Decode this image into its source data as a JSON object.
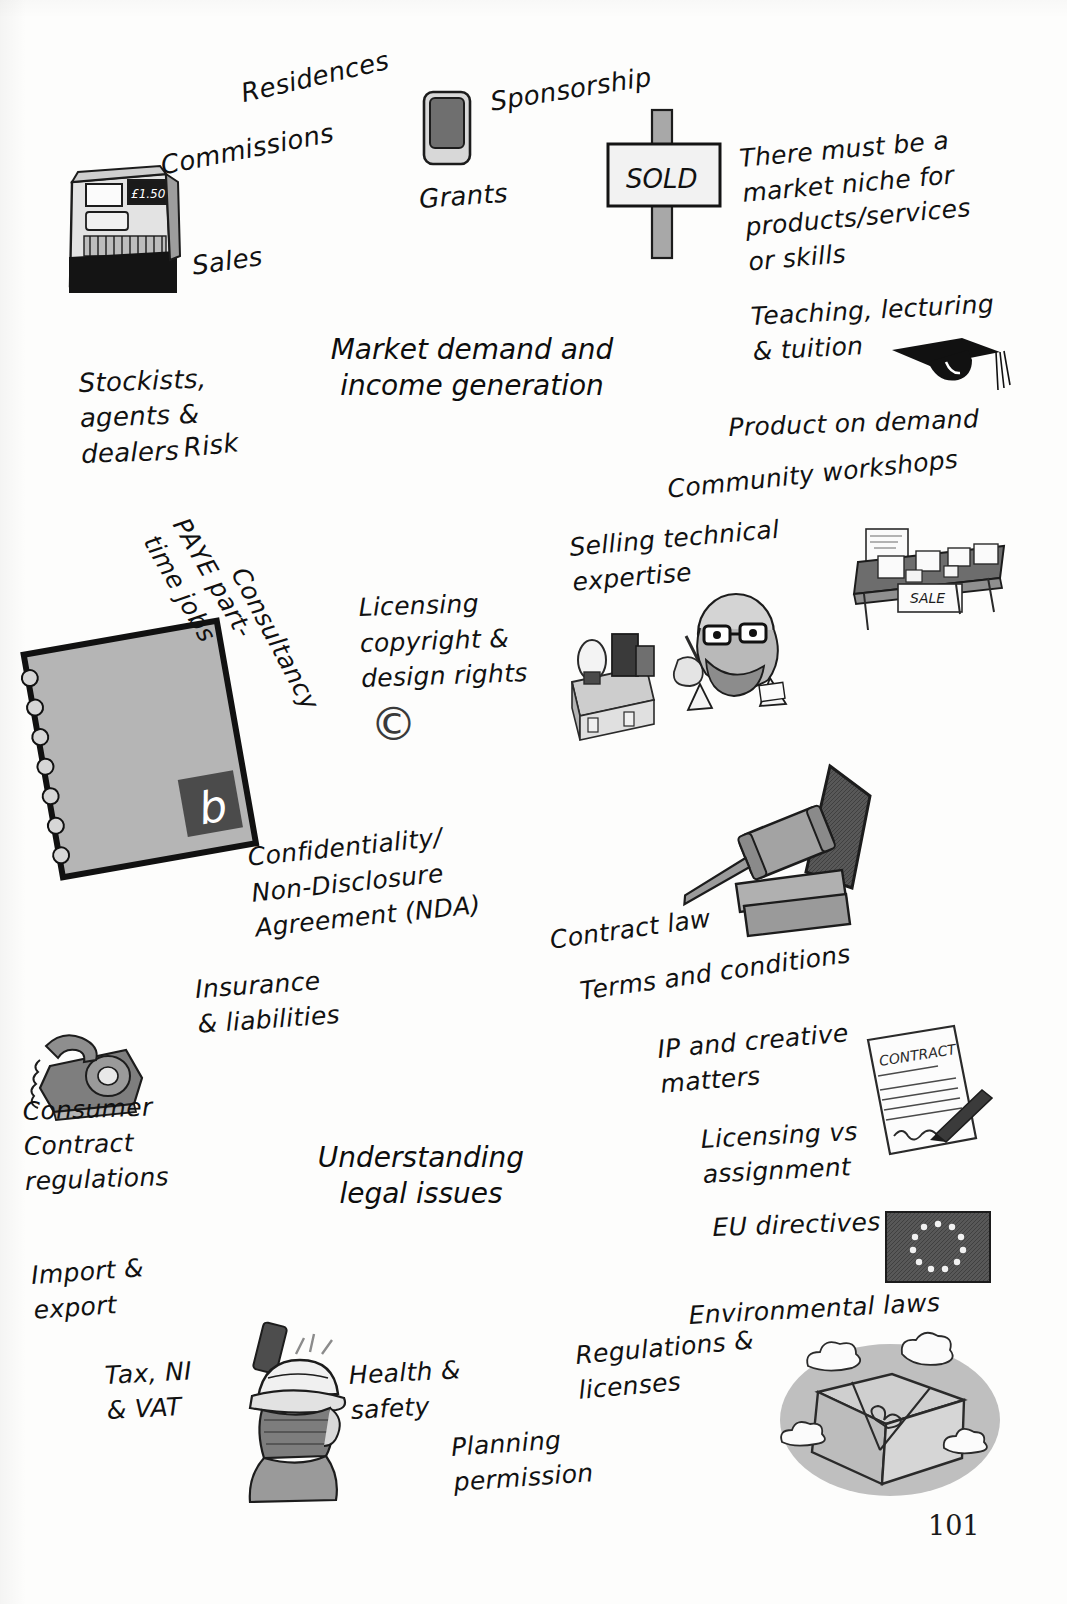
{
  "document": {
    "type": "hand-drawn mind map",
    "page_number": "101"
  },
  "nodes": [
    {
      "id": "market",
      "label": "Market demand and\nincome generation"
    },
    {
      "id": "legal",
      "label": "Understanding\nlegal issues"
    }
  ],
  "market_branches": [
    {
      "id": "residences",
      "label": "Residences"
    },
    {
      "id": "commissions",
      "label": "Commissions"
    },
    {
      "id": "sales",
      "label": "Sales"
    },
    {
      "id": "grants",
      "label": "Grants"
    },
    {
      "id": "sponsorship",
      "label": "Sponsorship"
    },
    {
      "id": "niche",
      "label": "There must be a\nmarket niche for\nproducts/services\nor skills"
    },
    {
      "id": "teaching",
      "label": "Teaching, lecturing\n& tuition"
    },
    {
      "id": "product-on-demand",
      "label": "Product on demand"
    },
    {
      "id": "community-workshops",
      "label": "Community workshops"
    },
    {
      "id": "selling-technical-expertise",
      "label": "Selling technical\nexpertise"
    },
    {
      "id": "licensing-copyright",
      "label": "Licensing\ncopyright &\ndesign rights"
    },
    {
      "id": "consultancy",
      "label": "Consultancy"
    },
    {
      "id": "paye",
      "label": "PAYE part-\ntime jobs"
    },
    {
      "id": "risk",
      "label": "Risk"
    },
    {
      "id": "stockists",
      "label": "Stockists,\nagents &\ndealers"
    }
  ],
  "legal_branches": [
    {
      "id": "nda",
      "label": "Confidentiality/\nNon-Disclosure\nAgreement (NDA)"
    },
    {
      "id": "insurance",
      "label": "Insurance\n& liabilities"
    },
    {
      "id": "contract-law",
      "label": "Contract law"
    },
    {
      "id": "terms",
      "label": "Terms and conditions"
    },
    {
      "id": "ip-creative",
      "label": "IP and creative\nmatters"
    },
    {
      "id": "licensing-vs-assignment",
      "label": "Licensing vs\nassignment"
    },
    {
      "id": "eu-directives",
      "label": "EU directives"
    },
    {
      "id": "environmental",
      "label": "Environmental laws"
    },
    {
      "id": "regulations",
      "label": "Regulations &\nlicenses"
    },
    {
      "id": "planning",
      "label": "Planning\npermission"
    },
    {
      "id": "health-safety",
      "label": "Health &\nsafety"
    },
    {
      "id": "tax-ni-vat",
      "label": "Tax, NI\n& VAT"
    },
    {
      "id": "import-export",
      "label": "Import &\nexport"
    },
    {
      "id": "consumer-contract",
      "label": "Consumer\nContract\nregulations"
    }
  ],
  "illustrations": [
    {
      "id": "cash-register",
      "name": "cash-register-icon",
      "caption": "£1.50"
    },
    {
      "id": "wallet",
      "name": "wallet-icon",
      "caption": ""
    },
    {
      "id": "sold-sign",
      "name": "sold-sign-icon",
      "caption": "SOLD"
    },
    {
      "id": "graduation-cap",
      "name": "graduation-cap-icon",
      "caption": ""
    },
    {
      "id": "sale-table",
      "name": "sale-table-icon",
      "caption": "SALE"
    },
    {
      "id": "technician",
      "name": "technician-icon",
      "caption": ""
    },
    {
      "id": "my-plan-book",
      "name": "notebook-icon",
      "caption": "MY\nPLAN",
      "badge": "b"
    },
    {
      "id": "gavel",
      "name": "gavel-icon",
      "caption": ""
    },
    {
      "id": "contract-doc",
      "name": "contract-document-icon",
      "caption": "CONTRACT"
    },
    {
      "id": "eu-flag",
      "name": "eu-flag-icon",
      "caption": ""
    },
    {
      "id": "telephone",
      "name": "rotary-telephone-icon",
      "caption": ""
    },
    {
      "id": "hard-hat-worker",
      "name": "hard-hat-worker-icon",
      "caption": ""
    },
    {
      "id": "parcel-cloud",
      "name": "parcel-cloud-icon",
      "caption": ""
    },
    {
      "id": "copyright",
      "name": "copyright-icon",
      "caption": "©"
    }
  ],
  "colors": {
    "ink": "#111111",
    "paper": "#fdfdfc",
    "node_fill": "#f7f7f5",
    "art_mid": "#8c8c8c",
    "art_dark": "#4a4a4a",
    "art_light": "#cfcfcf"
  }
}
